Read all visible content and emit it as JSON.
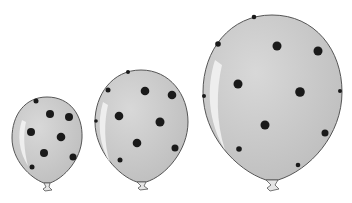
{
  "scene": {
    "description": "Three grey polka-dot balloons of increasing size",
    "background": "#ffffff",
    "balloon_fill": "#c9c9c9",
    "balloon_stroke": "#555555",
    "dot_color": "#1a1a1a",
    "highlight": "#f2f2f2"
  },
  "balloons": [
    {
      "name": "small",
      "cx": 47,
      "cy": 140,
      "rx": 35,
      "ry": 43,
      "knot_y": 187
    },
    {
      "name": "medium",
      "cx": 141,
      "cy": 125,
      "rx": 46,
      "ry": 56,
      "knot_y": 186
    },
    {
      "name": "large",
      "cx": 272,
      "cy": 97,
      "rx": 70,
      "ry": 82,
      "knot_y": 186
    }
  ]
}
